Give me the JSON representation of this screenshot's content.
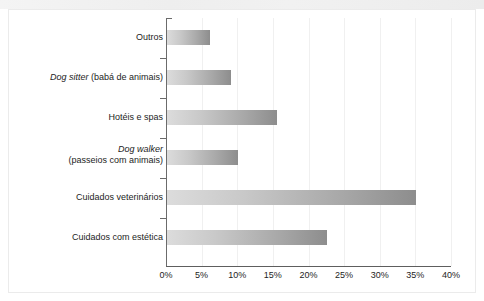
{
  "chart_data": {
    "type": "bar",
    "orientation": "horizontal",
    "title": "",
    "subtitle": "",
    "xlabel": "",
    "ylabel": "",
    "xlim": [
      0,
      40
    ],
    "grid": true,
    "legend": "none",
    "categories": [
      "Outros",
      "Dog sitter (babá de animais)",
      "Hotéis e spas",
      "Dog walker (passeios com animais)",
      "Cuidados veterinários",
      "Cuidados com estética"
    ],
    "values": [
      6,
      9,
      15.5,
      10,
      35,
      22.5
    ],
    "value_unit": "%",
    "tick_labels": [
      "0%",
      "5%",
      "10%",
      "15%",
      "20%",
      "25%",
      "30%",
      "35%",
      "40%"
    ],
    "tick_values": [
      0,
      5,
      10,
      15,
      20,
      25,
      30,
      35,
      40
    ],
    "bar_color_start": "#dcdcdc",
    "bar_color_end": "#8d8d8d",
    "axis_color": "#6b6b6b",
    "grid_color": "#f0f0f0"
  },
  "categories_rich": [
    {
      "line1_italic": "",
      "line1_plain": "Outros",
      "line2_plain": ""
    },
    {
      "line1_italic": "Dog sitter",
      "line1_plain": " (babá de animais)",
      "line2_plain": ""
    },
    {
      "line1_italic": "",
      "line1_plain": "Hotéis e spas",
      "line2_plain": ""
    },
    {
      "line1_italic": "Dog walker",
      "line1_plain": "",
      "line2_plain": "(passeios com animais)"
    },
    {
      "line1_italic": "",
      "line1_plain": "Cuidados veterinários",
      "line2_plain": ""
    },
    {
      "line1_italic": "",
      "line1_plain": "Cuidados com estética",
      "line2_plain": ""
    }
  ]
}
